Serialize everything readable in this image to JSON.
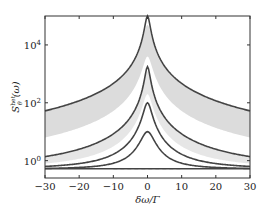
{
  "chart_data": {
    "type": "line",
    "title": "",
    "xlabel": "δω/Γ",
    "ylabel": "S_θ^het(ω)",
    "ylabel_parts": {
      "base": "S",
      "sup": "het",
      "sub": "θ",
      "arg": "(ω)"
    },
    "xlim": [
      -30,
      30
    ],
    "ylim_log10": [
      -0.6,
      5.0
    ],
    "yscale": "log",
    "grid": false,
    "legend": null,
    "x_ticks": [
      -30,
      -20,
      -10,
      0,
      10,
      20,
      30
    ],
    "x_tick_labels": [
      "−30",
      "−20",
      "−10",
      "0",
      "10",
      "20",
      "30"
    ],
    "y_ticks_log10": [
      0,
      2,
      4
    ],
    "y_tick_labels": [
      {
        "base": "10",
        "exp": "0"
      },
      {
        "base": "10",
        "exp": "2"
      },
      {
        "base": "10",
        "exp": "4"
      }
    ],
    "baseline_log10": -0.28,
    "series": [
      {
        "name": "curve-1",
        "peak_log10": 5.0,
        "edge_log10": 1.72,
        "color": "#444444"
      },
      {
        "name": "curve-2",
        "peak_log10": 3.25,
        "edge_log10": 0.14,
        "color": "#444444"
      },
      {
        "name": "curve-3",
        "peak_log10": 2.0,
        "edge_log10": -0.2,
        "color": "#444444"
      },
      {
        "name": "curve-4",
        "peak_log10": 1.0,
        "edge_log10": -0.27,
        "color": "#444444"
      }
    ],
    "bands": [
      {
        "name": "band-upper",
        "upper_peak_log10": 4.7,
        "upper_edge_log10": 1.7,
        "lower_peak_log10": 3.6,
        "lower_edge_log10": 0.8,
        "color": "#dcdcdc"
      },
      {
        "name": "band-lower",
        "upper_peak_log10": 3.1,
        "upper_edge_log10": 0.12,
        "lower_peak_log10": 2.3,
        "lower_edge_log10": -0.1,
        "color": "#e6e6e6"
      }
    ],
    "dashed_line": {
      "log10": -0.28,
      "x_range": [
        -10,
        10
      ],
      "color": "#888888"
    }
  }
}
